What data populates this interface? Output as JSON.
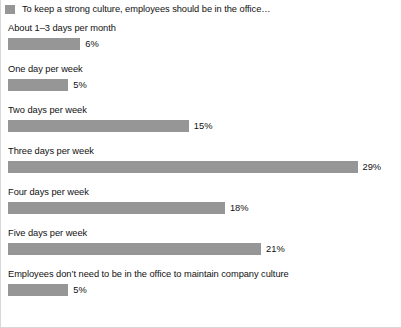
{
  "legend": {
    "swatch_name": "legend-color-swatch",
    "swatch_color": "#969696"
  },
  "chart_data": {
    "type": "bar",
    "orientation": "horizontal",
    "title": "To keep a strong culture, employees should be in the office…",
    "xlabel": "",
    "ylabel": "",
    "xlim": [
      0,
      29
    ],
    "grid": false,
    "legend_position": "top-left",
    "value_suffix": "%",
    "bar_color": "#969696",
    "categories": [
      "About 1–3 days per month",
      "One day per week",
      "Two days per week",
      "Three days per week",
      "Four days per week",
      "Five days per week",
      "Employees don’t need to be in the office to maintain company culture"
    ],
    "values": [
      6,
      5,
      15,
      29,
      18,
      21,
      5
    ],
    "value_labels": [
      "6%",
      "5%",
      "15%",
      "29%",
      "18%",
      "21%",
      "5%"
    ],
    "px_per_unit": 12.05
  }
}
